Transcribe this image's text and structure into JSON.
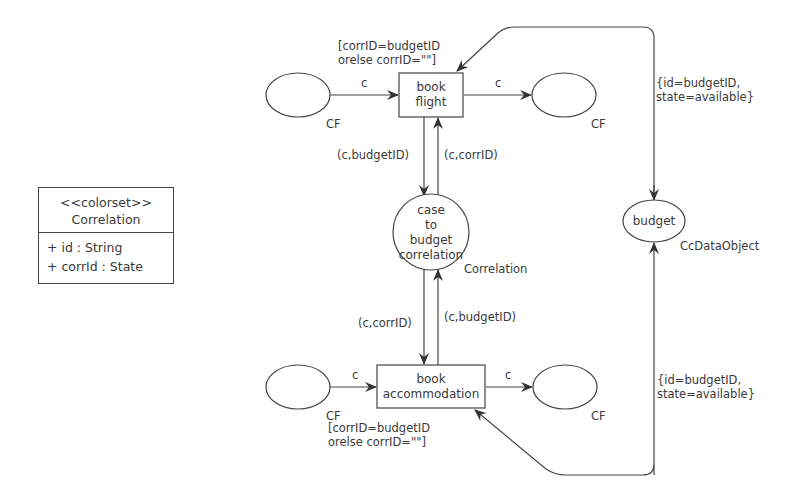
{
  "class_box": {
    "stereotype": "<<colorset>>",
    "name": "Correlation",
    "attributes": [
      "+ id : String",
      "+ corrId : State"
    ]
  },
  "places": {
    "cf_top_left": {
      "label": "",
      "type": "CF"
    },
    "cf_top_right": {
      "label": "",
      "type": "CF"
    },
    "cf_bottom_left": {
      "label": "",
      "type": "CF"
    },
    "cf_bottom_right": {
      "label": "",
      "type": "CF"
    },
    "correlation": {
      "label_lines": [
        "case",
        "to",
        "budget",
        "correlation"
      ],
      "type": "Correlation"
    },
    "budget": {
      "label": "budget",
      "type": "CcDataObject"
    }
  },
  "transitions": {
    "book_flight": {
      "label_lines": [
        "book",
        "flight"
      ],
      "guard_lines": [
        "[corrID=budgetID",
        "orelse corrID=\"\"]"
      ]
    },
    "book_accommodation": {
      "label_lines": [
        "book",
        "accommodation"
      ],
      "guard_lines": [
        "[corrID=budgetID",
        "orelse corrID=\"\"]"
      ]
    }
  },
  "arcs": {
    "cf_to_flight": "c",
    "flight_to_cf": "c",
    "cf_to_accommodation": "c",
    "accommodation_to_cf": "c",
    "flight_to_correlation": "(c,budgetID)",
    "correlation_to_flight": "(c,corrID)",
    "correlation_to_accommodation": "(c,corrID)",
    "accommodation_to_correlation": "(c,budgetID)",
    "budget_flight": [
      "{id=budgetID,",
      "state=available}"
    ],
    "budget_accommodation": [
      "{id=budgetID,",
      "state=available}"
    ]
  },
  "colors": {
    "stroke": "#444444",
    "text": "#3a3a3a",
    "background": "#ffffff"
  }
}
